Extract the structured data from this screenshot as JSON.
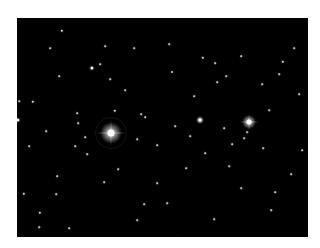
{
  "image": {
    "description": "Astronomical star field photograph on black background",
    "background_color": "#000000",
    "frame_color": "#ffffff",
    "bright_stars": [
      {
        "x": 94,
        "y": 115,
        "size": 7,
        "glow": 22,
        "spikes": true,
        "halo": 30
      },
      {
        "x": 232,
        "y": 104,
        "size": 5,
        "glow": 14,
        "spikes": true,
        "halo": 0
      },
      {
        "x": 183,
        "y": 102,
        "size": 3,
        "glow": 8,
        "spikes": false,
        "halo": 0
      }
    ],
    "stars": [
      [
        45,
        13,
        1.5
      ],
      [
        75,
        50,
        2
      ],
      [
        83,
        46,
        1
      ],
      [
        42,
        58,
        1
      ],
      [
        88,
        28,
        1
      ],
      [
        16,
        84,
        1.5
      ],
      [
        2,
        83,
        1
      ],
      [
        61,
        105,
        1
      ],
      [
        68,
        119,
        1
      ],
      [
        117,
        30,
        1
      ],
      [
        152,
        26,
        1
      ],
      [
        186,
        40,
        1.5
      ],
      [
        198,
        45,
        1
      ],
      [
        209,
        58,
        1
      ],
      [
        224,
        38,
        1
      ],
      [
        266,
        44,
        1.5
      ],
      [
        262,
        56,
        1
      ],
      [
        155,
        54,
        1.2
      ],
      [
        177,
        78,
        1
      ],
      [
        98,
        93,
        1.5
      ],
      [
        93,
        61,
        1
      ],
      [
        124,
        96,
        1
      ],
      [
        29,
        113,
        1
      ],
      [
        128,
        99,
        1
      ],
      [
        252,
        92,
        1
      ],
      [
        230,
        114,
        1
      ],
      [
        207,
        110,
        1
      ],
      [
        277,
        30,
        1
      ],
      [
        1,
        102,
        2
      ],
      [
        58,
        128,
        1
      ],
      [
        70,
        136,
        1
      ],
      [
        40,
        158,
        1
      ],
      [
        39,
        176,
        1
      ],
      [
        12,
        128,
        1
      ],
      [
        101,
        151,
        1
      ],
      [
        87,
        164,
        1
      ],
      [
        23,
        195,
        1.5
      ],
      [
        7,
        176,
        1.5
      ],
      [
        22,
        209,
        1
      ],
      [
        52,
        210,
        1
      ],
      [
        127,
        186,
        1
      ],
      [
        173,
        118,
        1
      ],
      [
        188,
        135,
        1
      ],
      [
        169,
        150,
        1
      ],
      [
        150,
        185,
        1
      ],
      [
        224,
        170,
        1
      ],
      [
        258,
        174,
        1
      ],
      [
        274,
        156,
        1
      ],
      [
        254,
        192,
        1
      ],
      [
        285,
        132,
        1
      ],
      [
        140,
        165,
        1
      ],
      [
        120,
        202,
        1
      ],
      [
        5,
        239,
        1
      ],
      [
        197,
        201,
        1
      ],
      [
        212,
        148,
        1
      ],
      [
        140,
        127,
        1
      ],
      [
        227,
        120,
        1
      ],
      [
        160,
        220,
        1
      ],
      [
        60,
        95,
        1
      ],
      [
        33,
        30,
        1
      ],
      [
        108,
        72,
        1
      ],
      [
        200,
        64,
        1
      ],
      [
        245,
        66,
        1
      ],
      [
        282,
        76,
        1
      ],
      [
        215,
        126,
        1
      ],
      [
        158,
        108,
        1
      ],
      [
        120,
        121,
        1
      ],
      [
        246,
        130,
        1
      ]
    ]
  }
}
